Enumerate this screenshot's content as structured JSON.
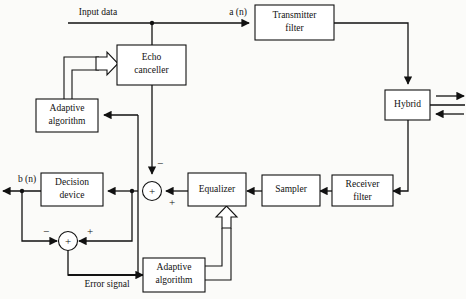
{
  "diagram": {
    "stroke_color": "#111111",
    "box_fill": "#ffffff",
    "background": "#fbfbf9",
    "blocks": [
      {
        "id": "echo_canceller",
        "label_line1": "Echo",
        "label_line2": "canceller"
      },
      {
        "id": "adaptive_algorithm_top",
        "label_line1": "Adaptive",
        "label_line2": "algorithm"
      },
      {
        "id": "decision_device",
        "label_line1": "Decision",
        "label_line2": "device"
      },
      {
        "id": "equalizer",
        "label_line1": "Equalizer",
        "label_line2": ""
      },
      {
        "id": "adaptive_algorithm_bottom",
        "label_line1": "Adaptive",
        "label_line2": "algorithm"
      },
      {
        "id": "transmitter_filter",
        "label_line1": "Transmitter",
        "label_line2": "filter"
      },
      {
        "id": "hybrid",
        "label_line1": "Hybrid",
        "label_line2": ""
      },
      {
        "id": "sampler",
        "label_line1": "Sampler",
        "label_line2": ""
      },
      {
        "id": "receiver_filter",
        "label_line1": "Receiver",
        "label_line2": "filter"
      }
    ],
    "signal_labels": {
      "input_data": "Input data",
      "a_n": "a (n)",
      "b_n": "b (n)",
      "error_signal": "Error signal"
    },
    "sign_labels": {
      "summer1_inside": "+",
      "summer1_minus": "−",
      "summer1_plus_right": "+",
      "summer2_inside": "+",
      "summer2_minus": "−",
      "summer2_plus_right": "+"
    }
  }
}
